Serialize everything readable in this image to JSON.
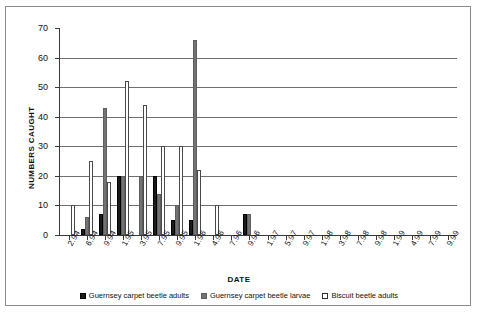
{
  "chart_data": {
    "type": "bar",
    "title": "",
    "xlabel": "DATE",
    "ylabel": "NUMBERS CAUGHT",
    "ylim": [
      0,
      70
    ],
    "ytick_step": 10,
    "yticks": [
      0,
      10,
      20,
      30,
      40,
      50,
      60,
      70
    ],
    "grid": "horizontal",
    "legend_position": "bottom-center",
    "categories": [
      "2.94",
      "6.94",
      "9.94",
      "1.95",
      "3.95",
      "7.95",
      "9.95",
      "1.96",
      "4.96",
      "7.96",
      "9.96",
      "1.97",
      "5.97",
      "9.97",
      "1.98",
      "3.98",
      "7.98",
      "9.98",
      "1.99",
      "4.99",
      "7.99",
      "9.99"
    ],
    "series": [
      {
        "name": "Guernsey carpet beetle adults",
        "color": "#1a1a1a",
        "values": [
          0,
          2,
          7,
          20,
          0,
          20,
          5,
          5,
          0,
          0,
          7,
          0,
          0,
          0,
          0,
          0,
          0,
          0,
          0,
          0,
          0,
          0
        ]
      },
      {
        "name": "Guernsey carpet beetle larvae",
        "color": "#737373",
        "values": [
          0,
          6,
          43,
          20,
          20,
          14,
          10,
          66,
          0,
          0,
          7,
          0,
          0,
          0,
          0,
          0,
          0,
          0,
          0,
          0,
          0,
          0
        ]
      },
      {
        "name": "Biscuit beetle adults",
        "color": "#ffffff",
        "values": [
          10,
          25,
          18,
          52,
          44,
          30,
          30,
          22,
          10,
          0,
          0,
          0,
          0,
          0,
          0,
          0,
          0,
          0,
          0,
          0,
          0,
          0
        ]
      }
    ]
  },
  "axis": {
    "y_title": "NUMBERS CAUGHT",
    "x_title": "DATE"
  },
  "legend": {
    "items": [
      {
        "label": "Guernsey carpet beetle adults"
      },
      {
        "label": "Guernsey carpet beetle larvae"
      },
      {
        "label": "Biscuit beetle adults"
      }
    ]
  }
}
